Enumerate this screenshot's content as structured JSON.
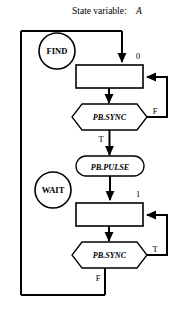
{
  "title": {
    "label": "State variable:",
    "variable": "A"
  },
  "states": [
    {
      "id": "find",
      "label": "FIND",
      "shape": "circle"
    },
    {
      "id": "wait",
      "label": "WAIT",
      "shape": "circle"
    }
  ],
  "nodes": [
    {
      "id": "box-0",
      "label": "",
      "shape": "rectangle",
      "output_label": "0"
    },
    {
      "id": "sync-1",
      "label": "PB.SYNC",
      "shape": "hexagon"
    },
    {
      "id": "pulse",
      "label": "PB.PULSE",
      "shape": "rounded-rectangle"
    },
    {
      "id": "box-1",
      "label": "",
      "shape": "rectangle",
      "output_label": "1"
    },
    {
      "id": "sync-2",
      "label": "PB.SYNC",
      "shape": "hexagon"
    }
  ],
  "edge_labels": {
    "box0_out": "0",
    "sync1_false": "F",
    "sync1_true": "T",
    "box1_out": "1",
    "sync2_true": "T",
    "sync2_false": "F"
  },
  "colors": {
    "line": "#000000",
    "fill": "#ffffff",
    "text": "#000000"
  }
}
